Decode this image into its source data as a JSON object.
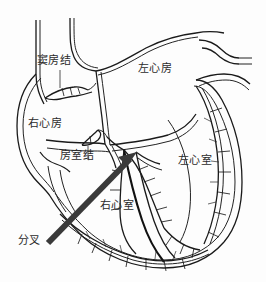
{
  "figure": {
    "kind": "anatomical-line-drawing",
    "background_color": "#fdfdfd",
    "ink_color": "#1d1d1d",
    "label_color": "#2b2b2b",
    "arrow_color": "#3a3a3a",
    "width": 266,
    "height": 282
  },
  "labels": [
    {
      "id": "sa-node",
      "text": "窦房结",
      "x": 37,
      "y": 55,
      "has_leader": true
    },
    {
      "id": "right-atrium",
      "text": "右心房",
      "x": 28,
      "y": 118,
      "has_leader": false
    },
    {
      "id": "left-atrium",
      "text": "左心房",
      "x": 138,
      "y": 63,
      "has_leader": false
    },
    {
      "id": "av-node",
      "text": "房室结",
      "x": 60,
      "y": 150,
      "has_leader": true
    },
    {
      "id": "left-ventricle",
      "text": "左心室",
      "x": 178,
      "y": 155,
      "has_leader": false
    },
    {
      "id": "right-ventricle",
      "text": "右心室",
      "x": 100,
      "y": 200,
      "has_leader": false
    },
    {
      "id": "bifurcation",
      "text": "分叉",
      "x": 18,
      "y": 235,
      "has_leader": false
    }
  ],
  "annotation_arrow": {
    "name": "bifurcation-pointer-arrow",
    "from_x": 48,
    "from_y": 243,
    "to_x": 137,
    "to_y": 152,
    "color": "#3a3a3a",
    "thickness": 6,
    "points_to": "分叉"
  },
  "anatomy_parts": [
    "上腔静脉",
    "下腔静脉",
    "主动脉",
    "肺静脉",
    "右心房",
    "左心房",
    "右心室",
    "左心室",
    "窦房结",
    "房室结",
    "房室束",
    "浦肯野纤维"
  ]
}
